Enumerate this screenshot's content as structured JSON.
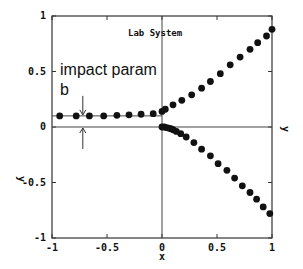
{
  "chart_data": {
    "type": "scatter",
    "title": "Lab System",
    "xlabel": "x",
    "ylabel": "y",
    "xlim": [
      -1,
      1
    ],
    "ylim": [
      -1,
      1
    ],
    "grid": false,
    "x_ticks": [
      -1,
      -0.5,
      0,
      0.5,
      1
    ],
    "x_tick_labels": [
      "-1",
      "-0.5",
      "0",
      "0.5",
      "1"
    ],
    "y_ticks": [
      -1,
      -0.5,
      0,
      0.5,
      1
    ],
    "y_tick_labels": [
      "-1",
      "-0.5",
      "0",
      "0.5",
      "1"
    ],
    "annotations": [
      {
        "text": "impact param",
        "x": -0.93,
        "y": 0.5
      },
      {
        "text": "b",
        "x": -0.93,
        "y": 0.34
      }
    ],
    "reference_lines": [
      {
        "orientation": "horizontal",
        "y": 0.1,
        "x_range": [
          -1,
          0
        ]
      },
      {
        "orientation": "horizontal",
        "y": 0,
        "x_range": [
          -1,
          1
        ]
      },
      {
        "orientation": "vertical",
        "x": 0,
        "y_range": [
          -1,
          1
        ]
      }
    ],
    "series": [
      {
        "name": "incoming projectile",
        "x": [
          -0.93,
          -0.78,
          -0.66,
          -0.53,
          -0.41,
          -0.3,
          -0.19,
          -0.08,
          0.0
        ],
        "y": [
          0.1,
          0.1,
          0.1,
          0.1,
          0.105,
          0.11,
          0.115,
          0.12,
          0.14
        ]
      },
      {
        "name": "scattered projectile",
        "x": [
          0.03,
          0.1,
          0.18,
          0.27,
          0.36,
          0.44,
          0.53,
          0.62,
          0.71,
          0.8,
          0.87,
          0.95,
          1.0
        ],
        "y": [
          0.16,
          0.2,
          0.24,
          0.29,
          0.35,
          0.41,
          0.48,
          0.56,
          0.63,
          0.7,
          0.76,
          0.82,
          0.88
        ]
      },
      {
        "name": "recoil target",
        "x": [
          0.0,
          0.02,
          0.04,
          0.06,
          0.08,
          0.1,
          0.13,
          0.17,
          0.22,
          0.29,
          0.36,
          0.44,
          0.51,
          0.59,
          0.66,
          0.73,
          0.8,
          0.86,
          0.92,
          0.98
        ],
        "y": [
          0.0,
          0.0,
          -0.005,
          -0.01,
          -0.015,
          -0.025,
          -0.04,
          -0.06,
          -0.09,
          -0.14,
          -0.2,
          -0.26,
          -0.33,
          -0.39,
          -0.46,
          -0.53,
          -0.59,
          -0.65,
          -0.72,
          -0.78
        ]
      }
    ]
  },
  "labels": {
    "title": "Lab System",
    "xlabel": "x",
    "ylabel_left": "y",
    "ylabel_right": "y",
    "annot_line1": "impact param",
    "annot_line2": "b"
  }
}
